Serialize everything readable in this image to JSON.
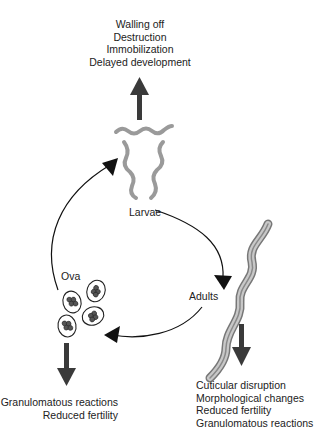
{
  "stages": {
    "larvae": {
      "label": "Larvae"
    },
    "adults": {
      "label": "Adults"
    },
    "ova": {
      "label": "Ova"
    }
  },
  "effects": {
    "larvae": [
      "Walling off",
      "Destruction",
      "Immobilization",
      "Delayed development"
    ],
    "ova": [
      "Granulomatous reactions",
      "Reduced fertility"
    ],
    "adults": [
      "Cuticular disruption",
      "Morphological changes",
      "Reduced fertility",
      "Granulomatous reactions"
    ]
  },
  "colors": {
    "effect_arrow": "#3a3a3a",
    "cycle_arrow": "#111111",
    "worm": "#9a9a9a",
    "background": "#ffffff"
  }
}
